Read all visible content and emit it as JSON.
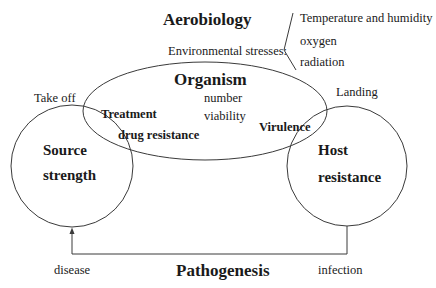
{
  "title": "Aerobiology",
  "environment": {
    "label": "Environmental stresses:",
    "items": [
      "Temperature and humidity",
      "oxygen",
      "radiation"
    ]
  },
  "organism": {
    "title": "Organism",
    "attributes": [
      "number",
      "viability"
    ],
    "treatment": "Treatment",
    "drug_resistance": "drug resistance",
    "virulence": "Virulence"
  },
  "source": {
    "line1": "Source",
    "line2": "strength",
    "takeoff": "Take off"
  },
  "host": {
    "line1": "Host",
    "line2": "resistance",
    "landing": "Landing"
  },
  "pathogenesis": {
    "title": "Pathogenesis",
    "disease": "disease",
    "infection": "infection"
  },
  "colors": {
    "stroke": "#3a3a3a",
    "text": "#1a1a1a"
  }
}
